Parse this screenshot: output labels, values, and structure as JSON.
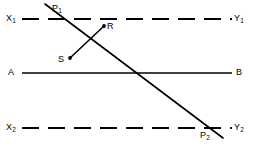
{
  "figure": {
    "type": "geometry-diagram",
    "width": 257,
    "height": 151,
    "background_color": "#ffffff",
    "stroke_color": "#000000"
  },
  "lines": {
    "top_parallel": {
      "name": "X1Y1",
      "style": "dashed",
      "dash_length": 17,
      "gap_length": 9,
      "y": 19,
      "x_start": 22,
      "x_end": 232,
      "left_label": "X",
      "left_label_sub": "1",
      "right_label": "Y",
      "right_label_sub": "1"
    },
    "middle_transversal": {
      "name": "AB",
      "style": "solid",
      "y": 73,
      "x_start": 22,
      "x_end": 232,
      "left_label": "A",
      "right_label": "B"
    },
    "bottom_parallel": {
      "name": "X2Y2",
      "style": "dashed",
      "dash_length": 17,
      "gap_length": 9,
      "y": 128,
      "x_start": 22,
      "x_end": 232,
      "left_label": "X",
      "left_label_sub": "2",
      "right_label": "Y",
      "right_label_sub": "2"
    },
    "main_diagonal": {
      "name": "P1P2",
      "style": "solid",
      "x1": 45,
      "y1": 4,
      "x2": 223,
      "y2": 138
    },
    "segment_rs": {
      "name": "RS",
      "style": "solid",
      "x1": 104,
      "y1": 26,
      "x2": 70,
      "y2": 58,
      "endpoint_dot_radius": 1.9
    }
  },
  "points": [
    {
      "id": "p1",
      "label": "P",
      "sub": "1",
      "label_x": 52,
      "label_y": 3,
      "description": "intersection of diagonal with top parallel line"
    },
    {
      "id": "r",
      "label": "R",
      "sub": "",
      "label_x": 107,
      "label_y": 21,
      "description": "upper endpoint of short segment"
    },
    {
      "id": "s",
      "label": "S",
      "sub": "",
      "label_x": 58,
      "label_y": 54,
      "description": "lower endpoint of short segment"
    },
    {
      "id": "p2",
      "label": "P",
      "sub": "2",
      "label_x": 200,
      "label_y": 130,
      "description": "intersection of diagonal with bottom parallel line"
    }
  ],
  "edge_labels": {
    "x1": {
      "text": "X",
      "sub": "1",
      "x": 6,
      "y": 13
    },
    "y1": {
      "text": "Y",
      "sub": "1",
      "x": 234,
      "y": 13
    },
    "a": {
      "text": "A",
      "sub": "",
      "x": 8,
      "y": 67
    },
    "b": {
      "text": "B",
      "sub": "",
      "x": 236,
      "y": 67
    },
    "x2": {
      "text": "X",
      "sub": "2",
      "x": 6,
      "y": 122
    },
    "y2": {
      "text": "Y",
      "sub": "2",
      "x": 234,
      "y": 122
    }
  }
}
